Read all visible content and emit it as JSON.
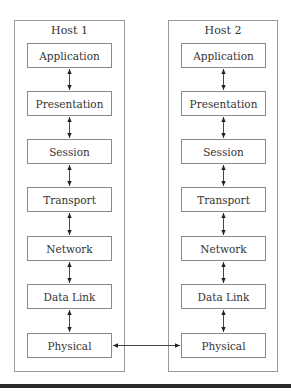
{
  "diagram": {
    "type": "OSI layered network model, two hosts",
    "hosts": [
      {
        "title": "Host 1",
        "layers": [
          "Application",
          "Presentation",
          "Session",
          "Transport",
          "Network",
          "Data Link",
          "Physical"
        ]
      },
      {
        "title": "Host 2",
        "layers": [
          "Application",
          "Presentation",
          "Session",
          "Transport",
          "Network",
          "Data Link",
          "Physical"
        ]
      }
    ],
    "edges": [
      {
        "from": "Host 1 / Physical",
        "to": "Host 2 / Physical",
        "style": "double-arrow"
      },
      {
        "between": "adjacent layers within each host",
        "style": "double-arrow"
      }
    ]
  }
}
